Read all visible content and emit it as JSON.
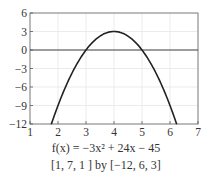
{
  "chart_data": {
    "type": "line",
    "title": "",
    "function": "f(x) = -3x^2 + 24x - 45",
    "xlabel": "",
    "ylabel": "",
    "xlim": [
      1,
      7
    ],
    "ylim": [
      -12,
      6
    ],
    "xticks": [
      1,
      2,
      3,
      4,
      5,
      6,
      7
    ],
    "yticks": [
      6,
      3,
      0,
      -3,
      -6,
      -9,
      -12
    ],
    "xtick_labels": [
      "1",
      "2",
      "3",
      "4",
      "5",
      "6",
      "7"
    ],
    "ytick_labels": [
      "6",
      "3",
      "0",
      "−3",
      "−6",
      "−9",
      "−12"
    ],
    "grid": true,
    "series": [
      {
        "name": "f(x)",
        "x": [
          1.76,
          2,
          2.5,
          3,
          3.5,
          4,
          4.5,
          5,
          5.5,
          6,
          6.24
        ],
        "values": [
          -12,
          -9,
          -3.75,
          0,
          2.25,
          3,
          2.25,
          0,
          -3.75,
          -9,
          -12
        ]
      }
    ],
    "annotations": [
      "vertex (4, 3)",
      "roots x=3, x=5"
    ]
  },
  "caption": {
    "function_label": "f(x) = −3x² + 24x − 45",
    "window_label": "[1, 7, 1 ] by [−12, 6, 3]"
  }
}
